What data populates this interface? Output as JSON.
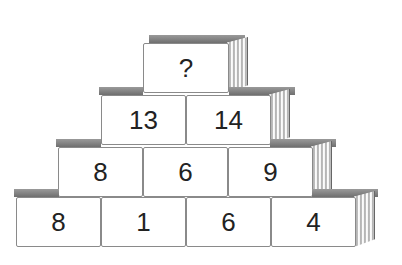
{
  "puzzle": {
    "type": "number-pyramid",
    "rows": [
      {
        "cells": [
          "?"
        ]
      },
      {
        "cells": [
          "13",
          "14"
        ]
      },
      {
        "cells": [
          "8",
          "6",
          "9"
        ]
      },
      {
        "cells": [
          "8",
          "1",
          "6",
          "4"
        ]
      }
    ]
  },
  "colors": {
    "cell_background": "#ffffff",
    "cell_border": "#8a8a8a",
    "text": "#222222",
    "stack_shadow": "#8c8c8c"
  }
}
